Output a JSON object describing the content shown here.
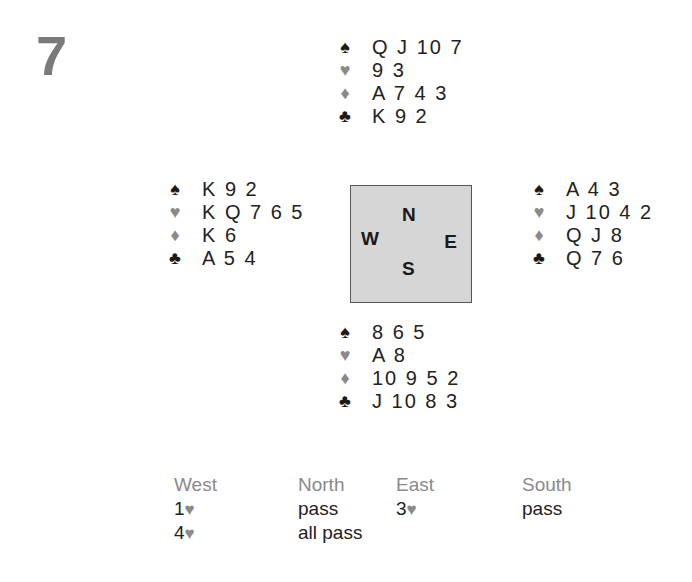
{
  "board_number": "7",
  "suits": {
    "spade": {
      "symbol": "♠",
      "color": "#1a1a1a"
    },
    "heart": {
      "symbol": "♥",
      "color": "#8a8a8a"
    },
    "diamond": {
      "symbol": "♦",
      "color": "#8a8a8a"
    },
    "club": {
      "symbol": "♣",
      "color": "#1a1a1a"
    }
  },
  "hands": {
    "north": {
      "spades": "Q J 10 7",
      "hearts": "9 3",
      "diamonds": "A 7 4 3",
      "clubs": "K 9 2"
    },
    "west": {
      "spades": "K 9 2",
      "hearts": "K Q 7 6 5",
      "diamonds": "K 6",
      "clubs": "A 5 4"
    },
    "east": {
      "spades": "A 4 3",
      "hearts": "J 10 4 2",
      "diamonds": "Q J 8",
      "clubs": "Q 7 6"
    },
    "south": {
      "spades": "8 6 5",
      "hearts": "A 8",
      "diamonds": "10 9 5 2",
      "clubs": "J 10 8 3"
    }
  },
  "compass": {
    "n": "N",
    "w": "W",
    "e": "E",
    "s": "S"
  },
  "auction": {
    "headers": [
      "West",
      "North",
      "East",
      "South"
    ],
    "rows": [
      [
        {
          "level": "1",
          "suit": "♥",
          "text": ""
        },
        {
          "level": "",
          "suit": "",
          "text": "pass"
        },
        {
          "level": "3",
          "suit": "♥",
          "text": ""
        },
        {
          "level": "",
          "suit": "",
          "text": "pass"
        }
      ],
      [
        {
          "level": "4",
          "suit": "♥",
          "text": ""
        },
        {
          "level": "",
          "suit": "",
          "text": "all pass"
        },
        {
          "level": "",
          "suit": "",
          "text": ""
        },
        {
          "level": "",
          "suit": "",
          "text": ""
        }
      ]
    ]
  }
}
